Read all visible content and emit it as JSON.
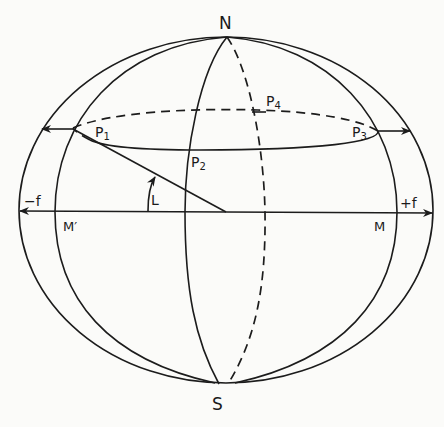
{
  "diagram": {
    "type": "sphere-geometry",
    "colors": {
      "ink": "#1c1c1c",
      "paper": "#fbfbf9"
    },
    "labels": {
      "north": "N",
      "south": "S",
      "p1": "P",
      "p1_sub": "1",
      "p2": "P",
      "p2_sub": "2",
      "p3": "P",
      "p3_sub": "3",
      "p4": "P",
      "p4_sub": "4",
      "angle": "L",
      "minus_f": "−f",
      "plus_f": "+f",
      "m_prime": "M′",
      "m": "M"
    }
  }
}
